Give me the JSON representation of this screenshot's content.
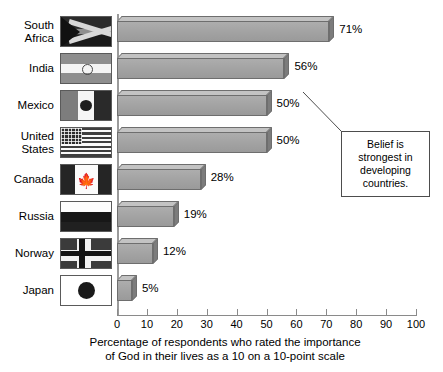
{
  "chart_data": {
    "type": "bar",
    "orientation": "horizontal",
    "title": "",
    "xlabel": "Percentage of respondents who rated the importance\nof God in their lives as a 10 on a 10-point scale",
    "ylabel": "",
    "categories": [
      "South Africa",
      "India",
      "Mexico",
      "United States",
      "Canada",
      "Russia",
      "Norway",
      "Japan"
    ],
    "values": [
      71,
      56,
      50,
      50,
      28,
      19,
      12,
      5
    ],
    "value_labels": [
      "71%",
      "56%",
      "50%",
      "50%",
      "28%",
      "19%",
      "12%",
      "5%"
    ],
    "xlim": [
      0,
      100
    ],
    "xticks": [
      0,
      10,
      20,
      30,
      40,
      50,
      60,
      70,
      80,
      90,
      100
    ],
    "xtick_labels": [
      "0",
      "10",
      "20",
      "30",
      "40",
      "50",
      "60",
      "70",
      "80",
      "90",
      "100"
    ],
    "grid": false,
    "legend": false,
    "annotations": [
      {
        "text": "Belief is\nstrongest in\ndeveloping\ncountries.",
        "points_at": "India"
      }
    ],
    "bar_style": "3d-block",
    "colors": {
      "bar_front": "#a2a2a2",
      "bar_top": "#c3c3c3",
      "bar_side": "#7c7c7c",
      "bar_outline": "#6e6e6e",
      "axis": "#8a8a8a",
      "baseline": "#9b9b9b",
      "text": "#000000",
      "background": "#ffffff",
      "callout_border": "#4d4d4d"
    }
  },
  "categories_display": [
    {
      "label": "South\nAfrica",
      "flag": "flag-south-africa",
      "value_label": "71%"
    },
    {
      "label": "India",
      "flag": "flag-india",
      "value_label": "56%"
    },
    {
      "label": "Mexico",
      "flag": "flag-mexico",
      "value_label": "50%"
    },
    {
      "label": "United\nStates",
      "flag": "flag-united-states",
      "value_label": "50%"
    },
    {
      "label": "Canada",
      "flag": "flag-canada",
      "value_label": "28%"
    },
    {
      "label": "Russia",
      "flag": "flag-russia",
      "value_label": "19%"
    },
    {
      "label": "Norway",
      "flag": "flag-norway",
      "value_label": "12%"
    },
    {
      "label": "Japan",
      "flag": "flag-japan",
      "value_label": "5%"
    }
  ],
  "callout": {
    "text": "Belief is\nstrongest in\ndeveloping\ncountries."
  },
  "axis": {
    "title": "Percentage of respondents who rated the importance\nof God in their lives as a 10 on a 10-point scale",
    "ticks": [
      "0",
      "10",
      "20",
      "30",
      "40",
      "50",
      "60",
      "70",
      "80",
      "90",
      "100"
    ]
  },
  "icons": {
    "canada_leaf": "🍁"
  }
}
